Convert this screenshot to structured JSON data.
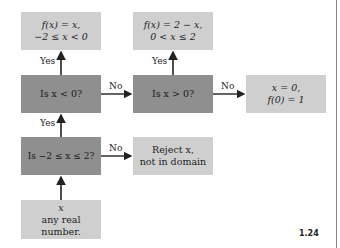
{
  "boxes": {
    "result_negative": {
      "line1": "f(x) = x,",
      "line2": "−2 ≤ x < 0"
    },
    "result_positive": {
      "line1": "f(x) = 2 − x,",
      "line2": "0 < x ≤ 2"
    },
    "decision_lt0": {
      "text": "Is  x < 0?"
    },
    "decision_gt0": {
      "text": "Is  x > 0?"
    },
    "result_zero": {
      "line1": "x = 0,",
      "line2": "f(0) = 1"
    },
    "decision_domain": {
      "text": "Is  −2 ≤ x ≤ 2?"
    },
    "reject": {
      "line1": "Reject  x,",
      "line2": "not in domain"
    },
    "input": {
      "line1": "x",
      "line2": "any real",
      "line3": "number."
    }
  },
  "edge_labels": {
    "lt0_yes": "Yes",
    "lt0_no": "No",
    "gt0_yes": "Yes",
    "gt0_no": "No",
    "domain_yes": "Yes",
    "domain_no": "No"
  },
  "figure_number": "1.24",
  "colors": {
    "light_box": "#cfcfcf",
    "dark_box": "#8f8f8f",
    "arrow": "#222222"
  }
}
